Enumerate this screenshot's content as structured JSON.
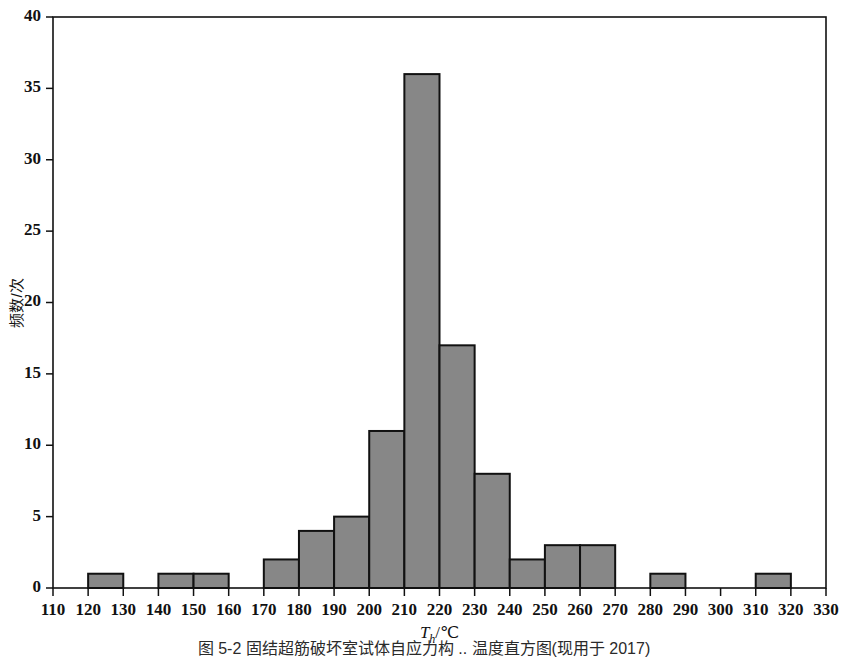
{
  "figure": {
    "caption": "图 5-2   固结超筋破坏室试体自应力构 .. 温度直方图(现用于 2017)",
    "caption_visible_fragment": "图 5-2   固结超筋破坏室试体自应力构 .. 温度直方图(现用于 2017)"
  },
  "chart_data": {
    "type": "bar",
    "title": "",
    "subtitle": "",
    "xlabel": "T_h/℃",
    "xlabel_base": "T",
    "xlabel_sub": "h",
    "xlabel_unit": "/℃",
    "ylabel": "频数/次",
    "xlim": [
      110,
      330
    ],
    "ylim": [
      0,
      40
    ],
    "x_tick_step": 10,
    "y_tick_step": 5,
    "bin_width": 10,
    "grid": false,
    "legend": false,
    "bar_color": "#878787",
    "bar_edge_color": "#111111",
    "axis_color": "#111111",
    "background_color": "#ffffff",
    "xticks": [
      110,
      120,
      130,
      140,
      150,
      160,
      170,
      180,
      190,
      200,
      210,
      220,
      230,
      240,
      250,
      260,
      270,
      280,
      290,
      300,
      310,
      320,
      330
    ],
    "yticks": [
      0,
      5,
      10,
      15,
      20,
      25,
      30,
      35,
      40
    ],
    "bin_starts": [
      110,
      120,
      130,
      140,
      150,
      160,
      170,
      180,
      190,
      200,
      210,
      220,
      230,
      240,
      250,
      260,
      270,
      280,
      290,
      300,
      310,
      320
    ],
    "categories": [
      "110-120",
      "120-130",
      "130-140",
      "140-150",
      "150-160",
      "160-170",
      "170-180",
      "180-190",
      "190-200",
      "200-210",
      "210-220",
      "220-230",
      "230-240",
      "240-250",
      "250-260",
      "260-270",
      "270-280",
      "280-290",
      "290-300",
      "300-310",
      "310-320",
      "320-330"
    ],
    "values": [
      0,
      1,
      0,
      1,
      1,
      0,
      2,
      4,
      5,
      11,
      36,
      17,
      8,
      2,
      3,
      3,
      0,
      1,
      0,
      0,
      1,
      0
    ],
    "total_count": 96,
    "peak_bin": "210-220",
    "peak_value": 36
  }
}
